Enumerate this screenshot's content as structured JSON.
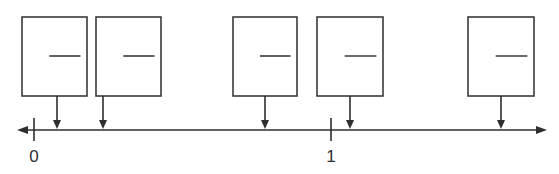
{
  "diagram": {
    "type": "number-line-with-answer-boxes",
    "number_line": {
      "y": 130,
      "x_start": 17,
      "x_end": 547,
      "double_arrow": true,
      "ticks": [
        {
          "label": "0",
          "x": 34
        },
        {
          "label": "1",
          "x": 331
        }
      ]
    },
    "boxes": [
      {
        "id": 1,
        "x": 22,
        "y": 17,
        "width": 65,
        "height": 79,
        "blank": "",
        "arrow_x": 57
      },
      {
        "id": 2,
        "x": 96,
        "y": 17,
        "width": 65,
        "height": 79,
        "blank": "",
        "arrow_x": 103
      },
      {
        "id": 3,
        "x": 233,
        "y": 17,
        "width": 64,
        "height": 79,
        "blank": "",
        "arrow_x": 265
      },
      {
        "id": 4,
        "x": 317,
        "y": 17,
        "width": 66,
        "height": 79,
        "blank": "",
        "arrow_x": 350
      },
      {
        "id": 5,
        "x": 468,
        "y": 17,
        "width": 66,
        "height": 79,
        "blank": "",
        "arrow_x": 501
      }
    ],
    "colors": {
      "stroke": "#2e2e2e",
      "background": "#ffffff"
    }
  }
}
